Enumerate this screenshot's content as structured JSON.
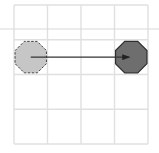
{
  "diagram": {
    "type": "grid-move",
    "grid": {
      "rows": 4,
      "cols": 4,
      "origin_x": 14,
      "origin_y": 5,
      "cell_w": 33.5,
      "cell_h": 34.75,
      "line_color": "#e0e0e0"
    },
    "guide_line": {
      "y": 29,
      "x1": 0,
      "x2": 159,
      "color": "#d8d8d8"
    },
    "start_piece": {
      "shape": "octagon",
      "row": 1,
      "col": 0,
      "fill": "#c6c6c6",
      "stroke": "#444444",
      "stroke_style": "dashed"
    },
    "end_piece": {
      "shape": "octagon",
      "row": 1,
      "col": 3,
      "fill": "#6e6e6e",
      "stroke": "#2e2e2e",
      "stroke_style": "solid"
    },
    "arrow": {
      "from": "start_piece",
      "to": "end_piece",
      "color": "#333333"
    }
  }
}
